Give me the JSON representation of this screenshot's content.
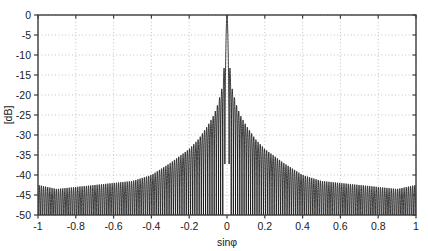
{
  "chart_data": {
    "type": "line",
    "title": "",
    "subtitle": "",
    "xlabel": "sinφ",
    "ylabel": "[dB]",
    "xlim": [
      -1,
      1
    ],
    "ylim": [
      -50,
      0
    ],
    "xticks": [
      -1,
      -0.8,
      -0.6,
      -0.4,
      -0.2,
      0,
      0.2,
      0.4,
      0.6,
      0.8,
      1
    ],
    "xticklabels": [
      "-1",
      "-0.8",
      "-0.6",
      "-0.4",
      "-0.2",
      "0",
      "0.2",
      "0.4",
      "0.6",
      "0.8",
      "1"
    ],
    "yticks": [
      0,
      -5,
      -10,
      -15,
      -20,
      -25,
      -30,
      -35,
      -40,
      -45,
      -50
    ],
    "yticklabels": [
      "0",
      "-5",
      "-10",
      "-15",
      "-20",
      "-25",
      "-30",
      "-35",
      "-40",
      "-45",
      "-50"
    ],
    "grid": true,
    "grid_style": "dotted",
    "grid_color": "#b4b4b4",
    "line_color": "#000000",
    "legend": null,
    "legend_position": "none",
    "annotations": [],
    "main_lobe": {
      "center": 0,
      "peak_db": 0,
      "first_sidelobe_db": -13.3,
      "half_width": 0.011
    },
    "sidelobe_envelope": {
      "x": [
        -1.0,
        -0.9,
        -0.8,
        -0.7,
        -0.6,
        -0.5,
        -0.4,
        -0.3,
        -0.2,
        -0.15,
        -0.1,
        -0.07,
        -0.05,
        -0.03,
        -0.02,
        0.0,
        0.02,
        0.03,
        0.05,
        0.07,
        0.1,
        0.15,
        0.2,
        0.3,
        0.4,
        0.5,
        0.6,
        0.7,
        0.8,
        0.9,
        1.0
      ],
      "peak_db": [
        -42.5,
        -43.5,
        -43.5,
        -43.0,
        -42.0,
        -41.0,
        -39.5,
        -37.0,
        -33.5,
        -31.0,
        -27.5,
        -25.0,
        -22.5,
        -19.0,
        -16.5,
        0.0,
        -16.5,
        -19.0,
        -22.5,
        -25.0,
        -27.5,
        -31.0,
        -33.5,
        -37.0,
        -40.0,
        -41.5,
        -42.0,
        -42.5,
        -43.0,
        -43.5,
        -42.5
      ]
    },
    "num_lobes": 176,
    "null_floor_db": -50
  },
  "figure": {
    "background_color": "#ffffff",
    "axes_color": "#3c3c3c",
    "plot_left": 38,
    "plot_top": 15,
    "plot_right": 416,
    "plot_bottom": 215
  }
}
